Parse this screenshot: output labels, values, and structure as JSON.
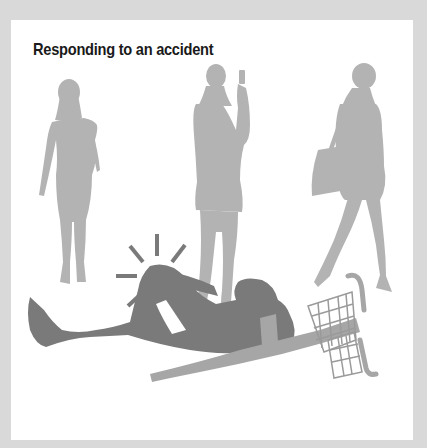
{
  "card": {
    "title": "Responding to an accident"
  },
  "illustration": {
    "description": "Three women silhouettes walk past a man lying on the ground next to a fallen bicycle, clutching his knee",
    "figures": [
      "woman-walking-left",
      "woman-taking-photo-with-phone",
      "woman-walking-with-handbag",
      "injured-cyclist-on-ground",
      "fallen-bicycle-with-basket"
    ],
    "pain-indicator": "impact-lines-around-knee"
  },
  "colors": {
    "background": "#d9d9d9",
    "card": "#ffffff",
    "title": "#1a1a1a",
    "bystander_silhouette": "#b3b3b3",
    "injured_silhouette": "#7a7a7a",
    "bicycle": "#a6a6a6"
  }
}
